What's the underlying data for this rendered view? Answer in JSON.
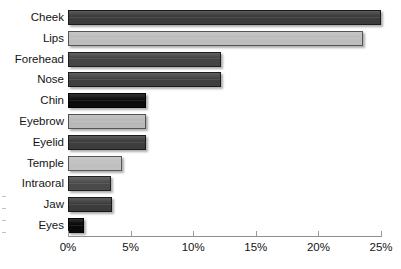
{
  "chart_data": {
    "type": "bar",
    "orientation": "horizontal",
    "title": "",
    "xlabel": "",
    "ylabel": "",
    "xlim": [
      0,
      25
    ],
    "xtick_labels": [
      "0%",
      "5%",
      "10%",
      "15%",
      "20%",
      "25%"
    ],
    "xticks": [
      0,
      5,
      10,
      15,
      20,
      25
    ],
    "grid": false,
    "legend": false,
    "categories": [
      "Cheek",
      "Lips",
      "Forehead",
      "Nose",
      "Chin",
      "Eyebrow",
      "Eyelid",
      "Temple",
      "Intraoral",
      "Jaw",
      "Eyes"
    ],
    "values": [
      25.0,
      23.6,
      12.2,
      12.2,
      6.2,
      6.2,
      6.2,
      4.3,
      3.4,
      3.5,
      1.3
    ],
    "value_unit": "%",
    "bar_colors": [
      "#3c3c3c",
      "#bdbdbd",
      "#444444",
      "#3f3f3f",
      "#0b0b0b",
      "#b9b9b9",
      "#3d3d3d",
      "#c0c0c0",
      "#4a4a4a",
      "#3b3b3b",
      "#090909"
    ],
    "bars": [
      {
        "label": "Cheek",
        "value": 25.0,
        "color": "#3c3c3c"
      },
      {
        "label": "Lips",
        "value": 23.6,
        "color": "#bdbdbd"
      },
      {
        "label": "Forehead",
        "value": 12.2,
        "color": "#444444"
      },
      {
        "label": "Nose",
        "value": 12.2,
        "color": "#3f3f3f"
      },
      {
        "label": "Chin",
        "value": 6.2,
        "color": "#0b0b0b"
      },
      {
        "label": "Eyebrow",
        "value": 6.2,
        "color": "#b9b9b9"
      },
      {
        "label": "Eyelid",
        "value": 6.2,
        "color": "#3d3d3d"
      },
      {
        "label": "Temple",
        "value": 4.3,
        "color": "#c0c0c0"
      },
      {
        "label": "Intraoral",
        "value": 3.4,
        "color": "#4a4a4a"
      },
      {
        "label": "Jaw",
        "value": 3.5,
        "color": "#3b3b3b"
      },
      {
        "label": "Eyes",
        "value": 1.3,
        "color": "#090909"
      }
    ]
  }
}
